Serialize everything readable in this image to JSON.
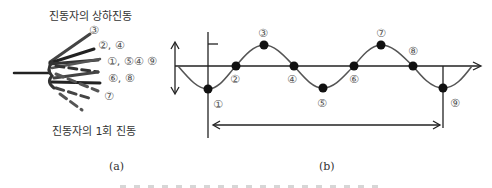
{
  "panel_a": {
    "title_top": "진동자의 상하진동",
    "title_bottom": "진동자의 1회 진동",
    "labels": {
      "l3": "③",
      "l24": "②, ④",
      "l159": "①, ⑤④ ⑨",
      "l68": "⑥, ⑧",
      "l7": "⑦"
    },
    "caption": "(a)"
  },
  "panel_b": {
    "points": [
      {
        "label": "①",
        "x": 208,
        "y": 89
      },
      {
        "label": "②",
        "x": 236,
        "y": 66
      },
      {
        "label": "③",
        "x": 264,
        "y": 45
      },
      {
        "label": "④",
        "x": 294,
        "y": 66
      },
      {
        "label": "⑤",
        "x": 323,
        "y": 88
      },
      {
        "label": "⑥",
        "x": 354,
        "y": 66
      },
      {
        "label": "⑦",
        "x": 381,
        "y": 45
      },
      {
        "label": "⑧",
        "x": 413,
        "y": 66
      },
      {
        "label": "⑨",
        "x": 443,
        "y": 88
      }
    ],
    "caption": "(b)"
  },
  "colors": {
    "line": "#222222",
    "wave": "#555555",
    "dot": "#111111"
  }
}
